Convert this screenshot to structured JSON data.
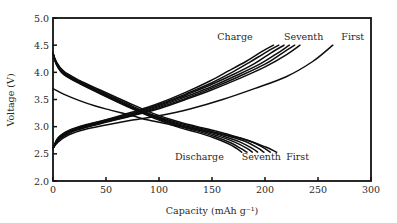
{
  "chart_data": {
    "type": "line",
    "title": "",
    "xlabel": "Capacity (mAh g⁻¹)",
    "ylabel": "Voltage (V)",
    "xlim": [
      0,
      300
    ],
    "ylim": [
      2.0,
      5.0
    ],
    "xticks": [
      0,
      50,
      100,
      150,
      200,
      250,
      300
    ],
    "yticks": [
      2.0,
      2.5,
      3.0,
      3.5,
      4.0,
      4.5,
      5.0
    ],
    "xtick_labels": [
      "0",
      "50",
      "100",
      "150",
      "200",
      "250",
      "300"
    ],
    "ytick_labels": [
      "2.0",
      "2.5",
      "3.0",
      "3.5",
      "4.0",
      "4.5",
      "5.0"
    ],
    "grid": false,
    "legend": "none",
    "annotations": [
      {
        "text": "Charge",
        "x": 155,
        "y": 4.6
      },
      {
        "text": "Seventh",
        "x": 218,
        "y": 4.6
      },
      {
        "text": "First",
        "x": 272,
        "y": 4.6
      },
      {
        "text": "Discharge",
        "x": 115,
        "y": 2.38
      },
      {
        "text": "Seventh",
        "x": 178,
        "y": 2.38
      },
      {
        "text": "First",
        "x": 220,
        "y": 2.38
      }
    ],
    "series": [
      {
        "name": "Charge cycle 1",
        "x": [
          0,
          5,
          15,
          30,
          50,
          75,
          100,
          130,
          160,
          190,
          220,
          245,
          264
        ],
        "y": [
          2.6,
          2.72,
          2.85,
          2.95,
          3.03,
          3.12,
          3.2,
          3.33,
          3.5,
          3.7,
          3.92,
          4.2,
          4.5
        ]
      },
      {
        "name": "Charge cycle 2",
        "x": [
          0,
          5,
          15,
          30,
          50,
          75,
          100,
          125,
          150,
          175,
          200,
          220,
          233
        ],
        "y": [
          2.6,
          2.75,
          2.88,
          2.98,
          3.08,
          3.2,
          3.33,
          3.5,
          3.68,
          3.88,
          4.1,
          4.32,
          4.5
        ]
      },
      {
        "name": "Charge cycle 3",
        "x": [
          0,
          5,
          15,
          30,
          50,
          75,
          100,
          125,
          150,
          175,
          200,
          216,
          228
        ],
        "y": [
          2.6,
          2.76,
          2.89,
          2.99,
          3.09,
          3.21,
          3.35,
          3.52,
          3.71,
          3.92,
          4.15,
          4.35,
          4.5
        ]
      },
      {
        "name": "Charge cycle 4",
        "x": [
          0,
          5,
          15,
          30,
          50,
          75,
          100,
          125,
          150,
          175,
          195,
          210,
          223
        ],
        "y": [
          2.6,
          2.77,
          2.9,
          3.0,
          3.1,
          3.22,
          3.37,
          3.55,
          3.74,
          3.96,
          4.15,
          4.33,
          4.5
        ]
      },
      {
        "name": "Charge cycle 5",
        "x": [
          0,
          5,
          15,
          30,
          50,
          75,
          100,
          125,
          150,
          170,
          190,
          205,
          218
        ],
        "y": [
          2.6,
          2.78,
          2.91,
          3.01,
          3.11,
          3.24,
          3.39,
          3.58,
          3.78,
          3.96,
          4.16,
          4.35,
          4.5
        ]
      },
      {
        "name": "Charge cycle 6",
        "x": [
          0,
          5,
          15,
          30,
          50,
          75,
          100,
          125,
          150,
          168,
          185,
          200,
          213
        ],
        "y": [
          2.6,
          2.79,
          2.92,
          3.02,
          3.12,
          3.25,
          3.41,
          3.6,
          3.81,
          3.99,
          4.18,
          4.36,
          4.5
        ]
      },
      {
        "name": "Charge cycle 7",
        "x": [
          0,
          5,
          15,
          30,
          50,
          75,
          100,
          125,
          148,
          165,
          182,
          196,
          208
        ],
        "y": [
          2.6,
          2.8,
          2.93,
          3.03,
          3.13,
          3.27,
          3.43,
          3.63,
          3.84,
          4.02,
          4.2,
          4.37,
          4.5
        ]
      },
      {
        "name": "Discharge cycle 1",
        "x": [
          0,
          10,
          25,
          40,
          55,
          75,
          90,
          110,
          130,
          155,
          180,
          200,
          211
        ],
        "y": [
          3.7,
          3.6,
          3.48,
          3.38,
          3.3,
          3.2,
          3.12,
          3.04,
          2.97,
          2.88,
          2.77,
          2.63,
          2.53
        ]
      },
      {
        "name": "Discharge cycle 2",
        "x": [
          0,
          3,
          10,
          25,
          45,
          70,
          95,
          120,
          145,
          165,
          185,
          198,
          205
        ],
        "y": [
          4.35,
          4.2,
          4.02,
          3.85,
          3.67,
          3.45,
          3.24,
          3.08,
          2.96,
          2.86,
          2.74,
          2.62,
          2.53
        ]
      },
      {
        "name": "Discharge cycle 3",
        "x": [
          0,
          3,
          10,
          25,
          45,
          70,
          95,
          120,
          145,
          163,
          181,
          193,
          199
        ],
        "y": [
          4.35,
          4.19,
          4.0,
          3.83,
          3.65,
          3.42,
          3.21,
          3.06,
          2.94,
          2.84,
          2.73,
          2.61,
          2.53
        ]
      },
      {
        "name": "Discharge cycle 4",
        "x": [
          0,
          3,
          10,
          25,
          45,
          70,
          95,
          120,
          143,
          160,
          176,
          188,
          193
        ],
        "y": [
          4.35,
          4.18,
          3.99,
          3.82,
          3.63,
          3.4,
          3.19,
          3.04,
          2.93,
          2.83,
          2.72,
          2.6,
          2.53
        ]
      },
      {
        "name": "Discharge cycle 5",
        "x": [
          0,
          3,
          10,
          25,
          45,
          70,
          95,
          118,
          140,
          157,
          172,
          183,
          188
        ],
        "y": [
          4.35,
          4.17,
          3.98,
          3.81,
          3.62,
          3.39,
          3.18,
          3.03,
          2.92,
          2.82,
          2.71,
          2.6,
          2.53
        ]
      },
      {
        "name": "Discharge cycle 6",
        "x": [
          0,
          3,
          10,
          25,
          45,
          70,
          95,
          117,
          138,
          154,
          168,
          178,
          183
        ],
        "y": [
          4.35,
          4.16,
          3.97,
          3.8,
          3.61,
          3.38,
          3.17,
          3.02,
          2.91,
          2.81,
          2.7,
          2.59,
          2.53
        ]
      },
      {
        "name": "Discharge cycle 7",
        "x": [
          0,
          3,
          10,
          25,
          45,
          70,
          95,
          115,
          135,
          151,
          165,
          174,
          178
        ],
        "y": [
          4.35,
          4.15,
          3.96,
          3.79,
          3.6,
          3.37,
          3.16,
          3.01,
          2.9,
          2.8,
          2.69,
          2.59,
          2.53
        ]
      }
    ]
  }
}
